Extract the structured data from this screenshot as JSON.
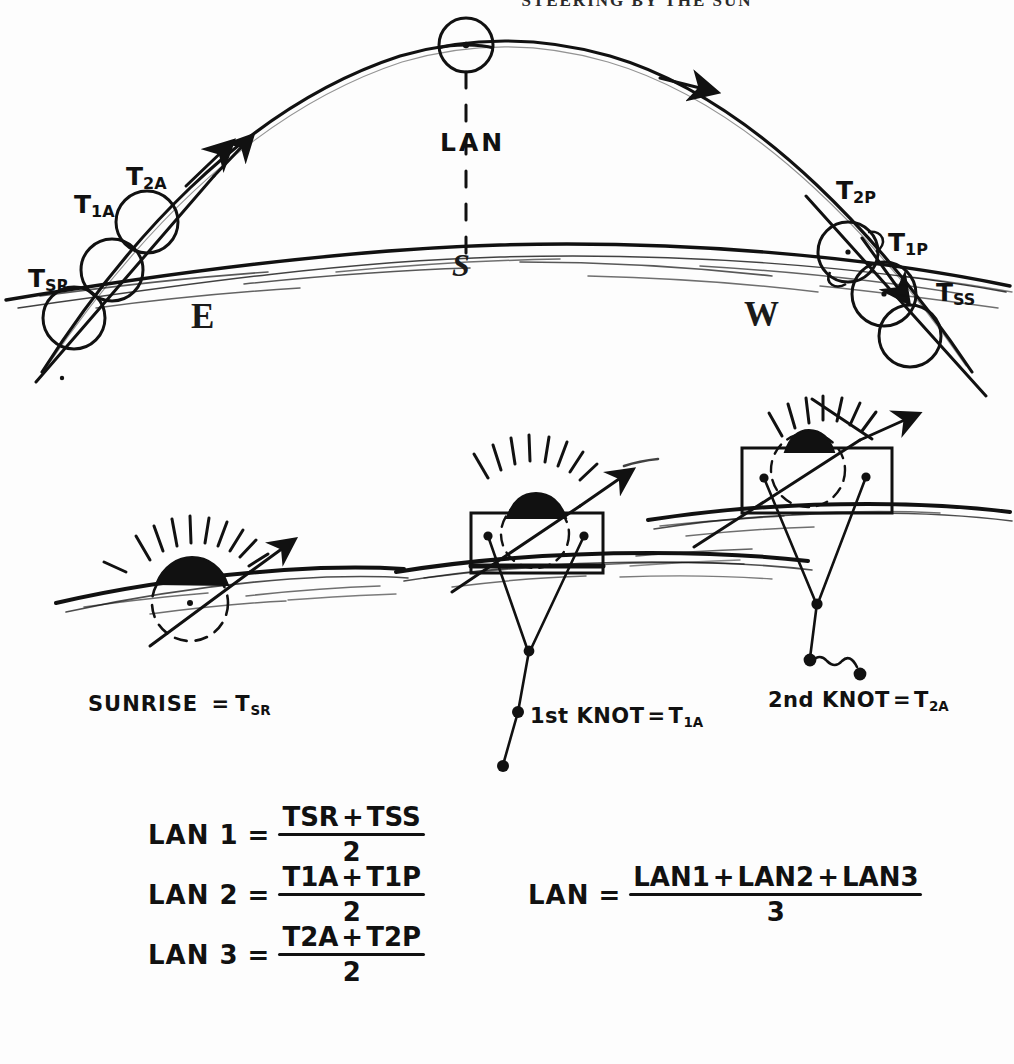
{
  "header": {
    "title": "STEERING BY THE SUN"
  },
  "diagram": {
    "name": "sun-path-arc-diagram",
    "compass": {
      "east": "E",
      "west": "W",
      "south": "S"
    },
    "apex_label": "LAN",
    "marks": [
      {
        "id": "tsr",
        "label": "T",
        "sub": "SR",
        "x": 28,
        "y": 268,
        "cx": 74,
        "cy": 318,
        "r": 30
      },
      {
        "id": "t1a",
        "label": "T",
        "sub": "1A",
        "x": 74,
        "y": 196,
        "cx": 112,
        "cy": 270,
        "r": 30
      },
      {
        "id": "t2a",
        "label": "T",
        "sub": "2A",
        "x": 128,
        "y": 168,
        "cx": 147,
        "cy": 222,
        "r": 30
      },
      {
        "id": "t2p",
        "label": "T",
        "sub": "2P",
        "x": 838,
        "y": 182,
        "cx": 848,
        "cy": 252,
        "r": 30
      },
      {
        "id": "t1p",
        "label": "T",
        "sub": "1P",
        "x": 890,
        "y": 234,
        "cx": 884,
        "cy": 294,
        "r": 30
      },
      {
        "id": "tss",
        "label": "T",
        "sub": "SS",
        "x": 938,
        "y": 283,
        "cx": 910,
        "cy": 335,
        "r": 30
      }
    ]
  },
  "vignettes": [
    {
      "id": "sunrise",
      "caption_pre": "SUNRISE",
      "eq": "=",
      "label": "T",
      "sub": "SR",
      "caption_x": 88,
      "caption_y": 694
    },
    {
      "id": "first-knot",
      "caption_pre": "1st KNOT",
      "eq": "=",
      "label": "T",
      "sub": "1A",
      "caption_x": 530,
      "caption_y": 706
    },
    {
      "id": "second-knot",
      "caption_pre": "2nd KNOT",
      "eq": "=",
      "label": "T",
      "sub": "2A",
      "caption_x": 768,
      "caption_y": 690
    }
  ],
  "formulas": {
    "left": [
      {
        "id": "lan1",
        "lhs": "LAN 1",
        "eq": "=",
        "num_a": "T",
        "num_a_sub": "SR",
        "plus": "+",
        "num_b": "T",
        "num_b_sub": "SS",
        "den": "2",
        "x": 148,
        "y": 806
      },
      {
        "id": "lan2",
        "lhs": "LAN 2",
        "eq": "=",
        "num_a": "T",
        "num_a_sub": "1A",
        "plus": "+",
        "num_b": "T",
        "num_b_sub": "1P",
        "den": "2",
        "x": 148,
        "y": 866
      },
      {
        "id": "lan3",
        "lhs": "LAN 3",
        "eq": "=",
        "num_a": "T",
        "num_a_sub": "2A",
        "plus": "+",
        "num_b": "T",
        "num_b_sub": "2P",
        "den": "2",
        "x": 148,
        "y": 926
      }
    ],
    "right": {
      "id": "lan-mean",
      "lhs": "LAN",
      "eq": "=",
      "terms": [
        "LAN1",
        "+",
        "LAN2",
        "+",
        "LAN3"
      ],
      "den": "3",
      "x": 528,
      "y": 866
    }
  }
}
